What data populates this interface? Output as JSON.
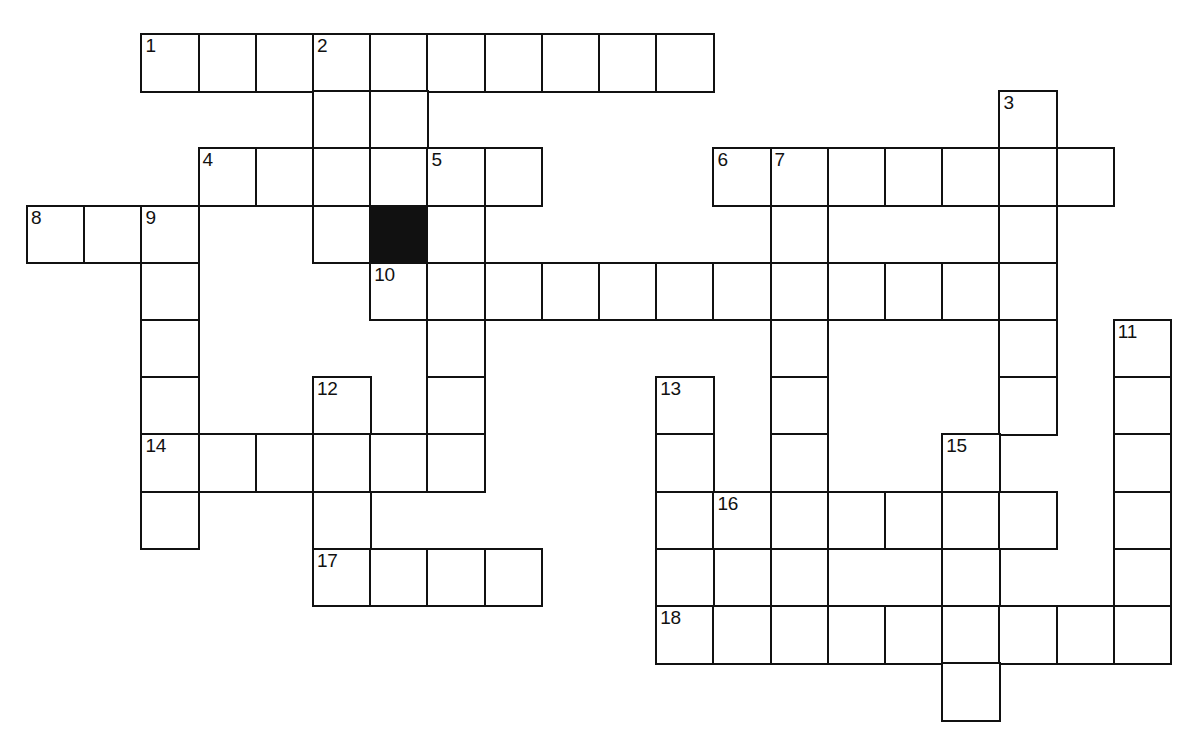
{
  "puzzle": {
    "kind": "crossword-grid",
    "title": "Crossword puzzle grid",
    "cell_size_px": 57.2,
    "origin_x_px": 26,
    "origin_y_px": 33,
    "grid_columns": 21,
    "grid_rows": 12,
    "colors": {
      "cell_fill": "#ffffff",
      "cell_border": "#111111",
      "block_fill": "#111111",
      "number_text": "#111111",
      "page_background": "#ffffff"
    },
    "clue_numbers": [
      "1",
      "2",
      "3",
      "4",
      "5",
      "6",
      "7",
      "8",
      "9",
      "10",
      "11",
      "12",
      "13",
      "14",
      "15",
      "16",
      "17",
      "18"
    ],
    "entries": [
      {
        "number": "1",
        "direction": "across",
        "col": 2,
        "row": 0,
        "length": 10
      },
      {
        "number": "2",
        "direction": "down",
        "col": 5,
        "row": 0,
        "length": 3
      },
      {
        "number": "3",
        "direction": "down",
        "col": 17,
        "row": 1,
        "length": 6
      },
      {
        "number": "4",
        "direction": "across",
        "col": 3,
        "row": 2,
        "length": 6
      },
      {
        "number": "5",
        "direction": "down",
        "col": 7,
        "row": 2,
        "length": 6
      },
      {
        "number": "6",
        "direction": "across",
        "col": 12,
        "row": 2,
        "length": 7
      },
      {
        "number": "7",
        "direction": "down",
        "col": 13,
        "row": 2,
        "length": 9
      },
      {
        "number": "8",
        "direction": "across",
        "col": 0,
        "row": 3,
        "length": 3
      },
      {
        "number": "9",
        "direction": "down",
        "col": 2,
        "row": 3,
        "length": 6
      },
      {
        "number": "10",
        "direction": "across",
        "col": 6,
        "row": 4,
        "length": 11
      },
      {
        "number": "11",
        "direction": "down",
        "col": 19,
        "row": 5,
        "length": 6
      },
      {
        "number": "12",
        "direction": "down",
        "col": 5,
        "row": 6,
        "length": 5
      },
      {
        "number": "13",
        "direction": "down",
        "col": 11,
        "row": 6,
        "length": 6
      },
      {
        "number": "14",
        "direction": "across",
        "col": 2,
        "row": 7,
        "length": 6
      },
      {
        "number": "15",
        "direction": "down",
        "col": 16,
        "row": 7,
        "length": 4
      },
      {
        "number": "16",
        "direction": "across",
        "col": 12,
        "row": 8,
        "length": 6
      },
      {
        "number": "17",
        "direction": "across",
        "col": 5,
        "row": 9,
        "length": 4
      },
      {
        "number": "18",
        "direction": "across",
        "col": 11,
        "row": 10,
        "length": 9
      }
    ],
    "block_cells": [
      {
        "col": 6,
        "row": 3
      }
    ],
    "cells": [
      {
        "col": 2,
        "row": 0,
        "number": "1"
      },
      {
        "col": 3,
        "row": 0
      },
      {
        "col": 4,
        "row": 0
      },
      {
        "col": 5,
        "row": 0,
        "number": "2"
      },
      {
        "col": 6,
        "row": 0
      },
      {
        "col": 7,
        "row": 0
      },
      {
        "col": 8,
        "row": 0
      },
      {
        "col": 9,
        "row": 0
      },
      {
        "col": 10,
        "row": 0
      },
      {
        "col": 11,
        "row": 0
      },
      {
        "col": 5,
        "row": 1
      },
      {
        "col": 6,
        "row": 1
      },
      {
        "col": 17,
        "row": 1,
        "number": "3"
      },
      {
        "col": 3,
        "row": 2,
        "number": "4"
      },
      {
        "col": 4,
        "row": 2
      },
      {
        "col": 5,
        "row": 2
      },
      {
        "col": 6,
        "row": 2
      },
      {
        "col": 7,
        "row": 2,
        "number": "5"
      },
      {
        "col": 8,
        "row": 2
      },
      {
        "col": 12,
        "row": 2,
        "number": "6"
      },
      {
        "col": 13,
        "row": 2,
        "number": "7"
      },
      {
        "col": 14,
        "row": 2
      },
      {
        "col": 15,
        "row": 2
      },
      {
        "col": 16,
        "row": 2
      },
      {
        "col": 17,
        "row": 2
      },
      {
        "col": 18,
        "row": 2
      },
      {
        "col": 0,
        "row": 3,
        "number": "8"
      },
      {
        "col": 1,
        "row": 3
      },
      {
        "col": 2,
        "row": 3,
        "number": "9"
      },
      {
        "col": 5,
        "row": 3
      },
      {
        "col": 6,
        "row": 3,
        "block": true
      },
      {
        "col": 7,
        "row": 3
      },
      {
        "col": 13,
        "row": 3
      },
      {
        "col": 17,
        "row": 3
      },
      {
        "col": 2,
        "row": 4
      },
      {
        "col": 6,
        "row": 4,
        "number": "10"
      },
      {
        "col": 7,
        "row": 4
      },
      {
        "col": 8,
        "row": 4
      },
      {
        "col": 9,
        "row": 4
      },
      {
        "col": 10,
        "row": 4
      },
      {
        "col": 11,
        "row": 4
      },
      {
        "col": 12,
        "row": 4
      },
      {
        "col": 13,
        "row": 4
      },
      {
        "col": 14,
        "row": 4
      },
      {
        "col": 15,
        "row": 4
      },
      {
        "col": 16,
        "row": 4
      },
      {
        "col": 17,
        "row": 4
      },
      {
        "col": 2,
        "row": 5
      },
      {
        "col": 7,
        "row": 5
      },
      {
        "col": 13,
        "row": 5
      },
      {
        "col": 17,
        "row": 5
      },
      {
        "col": 19,
        "row": 5,
        "number": "11"
      },
      {
        "col": 2,
        "row": 6
      },
      {
        "col": 5,
        "row": 6,
        "number": "12"
      },
      {
        "col": 7,
        "row": 6
      },
      {
        "col": 11,
        "row": 6,
        "number": "13"
      },
      {
        "col": 13,
        "row": 6
      },
      {
        "col": 17,
        "row": 6
      },
      {
        "col": 19,
        "row": 6
      },
      {
        "col": 2,
        "row": 7,
        "number": "14"
      },
      {
        "col": 3,
        "row": 7
      },
      {
        "col": 4,
        "row": 7
      },
      {
        "col": 5,
        "row": 7
      },
      {
        "col": 6,
        "row": 7
      },
      {
        "col": 7,
        "row": 7
      },
      {
        "col": 11,
        "row": 7
      },
      {
        "col": 13,
        "row": 7
      },
      {
        "col": 16,
        "row": 7,
        "number": "15"
      },
      {
        "col": 19,
        "row": 7
      },
      {
        "col": 2,
        "row": 8
      },
      {
        "col": 5,
        "row": 8
      },
      {
        "col": 11,
        "row": 8
      },
      {
        "col": 12,
        "row": 8,
        "number": "16"
      },
      {
        "col": 13,
        "row": 8
      },
      {
        "col": 14,
        "row": 8
      },
      {
        "col": 15,
        "row": 8
      },
      {
        "col": 16,
        "row": 8
      },
      {
        "col": 17,
        "row": 8
      },
      {
        "col": 19,
        "row": 8
      },
      {
        "col": 5,
        "row": 9,
        "number": "17"
      },
      {
        "col": 6,
        "row": 9
      },
      {
        "col": 7,
        "row": 9
      },
      {
        "col": 8,
        "row": 9
      },
      {
        "col": 11,
        "row": 9
      },
      {
        "col": 13,
        "row": 9
      },
      {
        "col": 16,
        "row": 9
      },
      {
        "col": 19,
        "row": 9
      },
      {
        "col": 11,
        "row": 10,
        "number": "18"
      },
      {
        "col": 12,
        "row": 10
      },
      {
        "col": 13,
        "row": 10
      },
      {
        "col": 14,
        "row": 10
      },
      {
        "col": 15,
        "row": 10
      },
      {
        "col": 16,
        "row": 10
      },
      {
        "col": 17,
        "row": 10
      },
      {
        "col": 18,
        "row": 10
      },
      {
        "col": 19,
        "row": 10
      },
      {
        "col": 16,
        "row": 11
      }
    ]
  }
}
